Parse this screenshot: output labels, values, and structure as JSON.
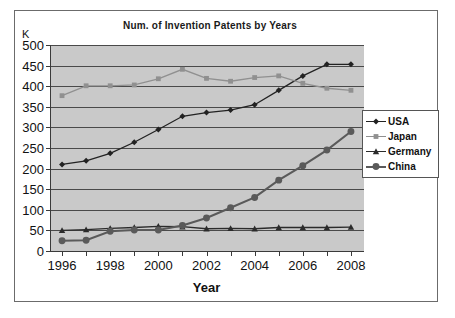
{
  "chart_data": {
    "type": "line",
    "title": "Num. of Invention Patents by Years",
    "xlabel": "Year",
    "ylabel": "K",
    "x": [
      1996,
      1997,
      1998,
      1999,
      2000,
      2001,
      2002,
      2003,
      2004,
      2005,
      2006,
      2007,
      2008
    ],
    "xlim": [
      1995.5,
      2008.5
    ],
    "ylim": [
      0,
      500
    ],
    "yticks": [
      0,
      50,
      100,
      150,
      200,
      250,
      300,
      350,
      400,
      450,
      500
    ],
    "xticks_labeled": [
      1996,
      1998,
      2000,
      2002,
      2004,
      2006,
      2008
    ],
    "grid": true,
    "legend_position": "right",
    "series": [
      {
        "name": "USA",
        "marker": "diamond",
        "color": "#222222",
        "values": [
          210,
          219,
          237,
          264,
          295,
          327,
          336,
          342,
          355,
          390,
          425,
          453,
          453
        ]
      },
      {
        "name": "Japan",
        "marker": "square",
        "color": "#909090",
        "values": [
          377,
          401,
          401,
          403,
          418,
          441,
          419,
          412,
          421,
          425,
          407,
          395,
          390
        ]
      },
      {
        "name": "Germany",
        "marker": "triangle",
        "color": "#2b2b2b",
        "values": [
          50,
          52,
          55,
          57,
          60,
          59,
          54,
          55,
          54,
          57,
          57,
          57,
          58
        ]
      },
      {
        "name": "China",
        "marker": "circle",
        "color": "#5a5a5a",
        "values": [
          25,
          26,
          48,
          51,
          51,
          62,
          80,
          105,
          130,
          172,
          207,
          245,
          290
        ]
      }
    ]
  },
  "legend": {
    "items": [
      {
        "label": "USA"
      },
      {
        "label": "Japan"
      },
      {
        "label": "Germany"
      },
      {
        "label": "China"
      }
    ]
  }
}
